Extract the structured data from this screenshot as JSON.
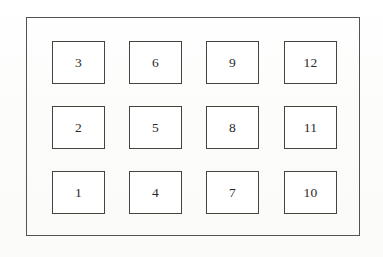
{
  "figure": {
    "type": "diagram",
    "background_color": "#fdfdfd",
    "outer_frame": {
      "name": "outer-enclosure-rectangle",
      "stroke_color": "#53534f",
      "fill": "none",
      "x": 26,
      "y": 17,
      "width": 334,
      "height": 219
    },
    "cell_style": {
      "stroke_color": "#45453f",
      "fill_color": "#ffffff"
    },
    "grid": {
      "columns": 4,
      "rows": 3,
      "cell_width": 53,
      "cell_height": 43,
      "column_x": [
        25,
        102,
        179,
        257
      ],
      "row_y": [
        23,
        88,
        153
      ],
      "numbering_order": "column-major, bottom-to-top"
    },
    "cells": [
      {
        "label": "3",
        "row": 0,
        "col": 0,
        "x": 25,
        "y": 23,
        "w": 53,
        "h": 43
      },
      {
        "label": "6",
        "row": 0,
        "col": 1,
        "x": 102,
        "y": 23,
        "w": 53,
        "h": 43
      },
      {
        "label": "9",
        "row": 0,
        "col": 2,
        "x": 179,
        "y": 23,
        "w": 53,
        "h": 43
      },
      {
        "label": "12",
        "row": 0,
        "col": 3,
        "x": 257,
        "y": 23,
        "w": 53,
        "h": 43
      },
      {
        "label": "2",
        "row": 1,
        "col": 0,
        "x": 25,
        "y": 88,
        "w": 53,
        "h": 43
      },
      {
        "label": "5",
        "row": 1,
        "col": 1,
        "x": 102,
        "y": 88,
        "w": 53,
        "h": 43
      },
      {
        "label": "8",
        "row": 1,
        "col": 2,
        "x": 179,
        "y": 88,
        "w": 53,
        "h": 43
      },
      {
        "label": "11",
        "row": 1,
        "col": 3,
        "x": 257,
        "y": 88,
        "w": 53,
        "h": 43
      },
      {
        "label": "1",
        "row": 2,
        "col": 0,
        "x": 25,
        "y": 153,
        "w": 53,
        "h": 43
      },
      {
        "label": "4",
        "row": 2,
        "col": 1,
        "x": 102,
        "y": 153,
        "w": 53,
        "h": 43
      },
      {
        "label": "7",
        "row": 2,
        "col": 2,
        "x": 179,
        "y": 153,
        "w": 53,
        "h": 43
      },
      {
        "label": "10",
        "row": 2,
        "col": 3,
        "x": 257,
        "y": 153,
        "w": 53,
        "h": 43
      }
    ]
  }
}
